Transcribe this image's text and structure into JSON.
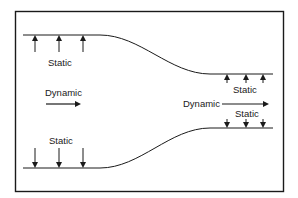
{
  "diagram": {
    "type": "venturi-pressure-diagram",
    "colors": {
      "line": "#1a1a1a",
      "background": "#ffffff"
    },
    "labels": {
      "static_top_left": "Static",
      "dynamic_left": "Dynamic",
      "static_top_right": "Static",
      "dynamic_right": "Dynamic",
      "static_bottom_right": "Static",
      "static_bottom_left": "Static"
    },
    "upper_wall": {
      "left_y": 35,
      "right_y": 74,
      "arrow_direction": "up"
    },
    "lower_wall": {
      "left_y": 168,
      "right_y": 128,
      "arrow_direction": "down"
    },
    "arrows": {
      "upper_left_x": [
        35,
        59,
        83
      ],
      "upper_right_x": [
        227,
        246,
        263
      ],
      "lower_left_x": [
        35,
        59,
        83
      ],
      "lower_right_x": [
        227,
        246,
        263
      ]
    }
  }
}
